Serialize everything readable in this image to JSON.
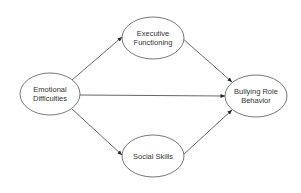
{
  "diagram": {
    "type": "path-model",
    "nodes": [
      {
        "id": "emotional",
        "lines": [
          "Emotional",
          "Difficulties"
        ],
        "cx": 50,
        "cy": 94,
        "rx": 30,
        "ry": 21
      },
      {
        "id": "executive",
        "lines": [
          "Executive",
          "Functioning"
        ],
        "cx": 153,
        "cy": 38,
        "rx": 31,
        "ry": 21
      },
      {
        "id": "social",
        "lines": [
          "Social Skills"
        ],
        "cx": 153,
        "cy": 156,
        "rx": 31,
        "ry": 21
      },
      {
        "id": "bullying",
        "lines": [
          "Bullying Role",
          "Behavior"
        ],
        "cx": 256,
        "cy": 96,
        "rx": 31,
        "ry": 21
      }
    ],
    "edges": [
      {
        "from": "emotional",
        "to": "executive",
        "x1": 72,
        "y1": 80,
        "x2": 122,
        "y2": 37
      },
      {
        "from": "emotional",
        "to": "bullying",
        "x1": 80,
        "y1": 95,
        "x2": 225,
        "y2": 96
      },
      {
        "from": "emotional",
        "to": "social",
        "x1": 72,
        "y1": 109,
        "x2": 122,
        "y2": 155
      },
      {
        "from": "executive",
        "to": "bullying",
        "x1": 182,
        "y1": 38,
        "x2": 232,
        "y2": 82
      },
      {
        "from": "social",
        "to": "bullying",
        "x1": 183,
        "y1": 155,
        "x2": 232,
        "y2": 110
      }
    ],
    "colors": {
      "stroke": "#555555",
      "text": "#333333",
      "background": "#ffffff"
    }
  }
}
